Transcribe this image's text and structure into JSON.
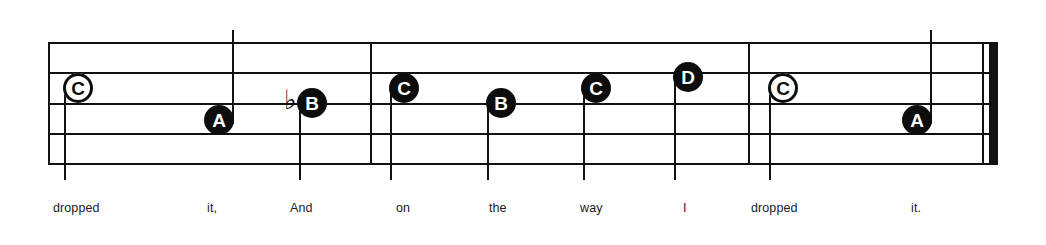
{
  "score": {
    "type": "music-notation-staff",
    "clef_shown": false,
    "staff": {
      "left": 48,
      "right": 990,
      "line_count": 5,
      "line_y": [
        42,
        72,
        103,
        133,
        163
      ],
      "line_color": "#111111"
    },
    "measures": [
      {
        "name": "measure-1",
        "start_x": 48,
        "end_x": 370
      },
      {
        "name": "measure-2",
        "start_x": 370,
        "end_x": 748
      },
      {
        "name": "measure-3",
        "start_x": 748,
        "end_x": 990
      }
    ],
    "barlines": [
      {
        "name": "barline-start",
        "x": 48,
        "style": "thin"
      },
      {
        "name": "barline-1",
        "x": 370,
        "style": "thin"
      },
      {
        "name": "barline-2",
        "x": 748,
        "style": "thin"
      },
      {
        "name": "barline-final-thin",
        "x": 982,
        "style": "thin"
      },
      {
        "name": "barline-final-thick",
        "x": 989,
        "style": "thick"
      }
    ],
    "notes": [
      {
        "id": "note-1",
        "letter": "C",
        "head": "hollow",
        "x": 78,
        "y": 88,
        "stem": "down",
        "stem_x": 64,
        "stem_top": 88,
        "stem_bottom": 180,
        "accidental": "",
        "lyric": "dropped"
      },
      {
        "id": "note-2",
        "letter": "A",
        "head": "filled",
        "x": 219,
        "y": 120,
        "stem": "up",
        "stem_x": 232,
        "stem_top": 30,
        "stem_bottom": 124,
        "accidental": "",
        "lyric": "it,"
      },
      {
        "id": "note-3",
        "letter": "B",
        "head": "filled",
        "x": 312,
        "y": 103,
        "stem": "down",
        "stem_x": 299,
        "stem_top": 103,
        "stem_bottom": 180,
        "accidental": "♭",
        "accidental_x": 284,
        "accidental_y": 86,
        "lyric": "And"
      },
      {
        "id": "note-4",
        "letter": "C",
        "head": "filled",
        "x": 404,
        "y": 88,
        "stem": "down",
        "stem_x": 390,
        "stem_top": 88,
        "stem_bottom": 180,
        "accidental": "",
        "lyric": "on"
      },
      {
        "id": "note-5",
        "letter": "B",
        "head": "filled",
        "x": 501,
        "y": 103,
        "stem": "down",
        "stem_x": 487,
        "stem_top": 103,
        "stem_bottom": 180,
        "accidental": "",
        "lyric": "the"
      },
      {
        "id": "note-6",
        "letter": "C",
        "head": "filled",
        "x": 596,
        "y": 88,
        "stem": "down",
        "stem_x": 583,
        "stem_top": 88,
        "stem_bottom": 180,
        "accidental": "",
        "lyric": "way"
      },
      {
        "id": "note-7",
        "letter": "D",
        "head": "filled",
        "x": 688,
        "y": 77,
        "stem": "down",
        "stem_x": 674,
        "stem_top": 77,
        "stem_bottom": 180,
        "accidental": "",
        "lyric": "I"
      },
      {
        "id": "note-8",
        "letter": "C",
        "head": "hollow",
        "x": 783,
        "y": 88,
        "stem": "down",
        "stem_x": 769,
        "stem_top": 88,
        "stem_bottom": 180,
        "accidental": "",
        "lyric": "dropped"
      },
      {
        "id": "note-9",
        "letter": "A",
        "head": "filled",
        "x": 917,
        "y": 120,
        "stem": "up",
        "stem_x": 930,
        "stem_top": 30,
        "stem_bottom": 124,
        "accidental": "",
        "lyric": "it."
      }
    ],
    "lyrics": [
      {
        "text": "dropped",
        "x": 53,
        "y": 202
      },
      {
        "text": "it,",
        "x": 207,
        "y": 202
      },
      {
        "text": "And",
        "x": 290,
        "y": 202
      },
      {
        "text": "on",
        "x": 396,
        "y": 202
      },
      {
        "text": "the",
        "x": 489,
        "y": 202
      },
      {
        "text": "way",
        "x": 580,
        "y": 202
      },
      {
        "text": "I",
        "x": 683,
        "y": 202
      },
      {
        "text": "dropped",
        "x": 751,
        "y": 202
      },
      {
        "text": "it.",
        "x": 911,
        "y": 202
      }
    ]
  }
}
